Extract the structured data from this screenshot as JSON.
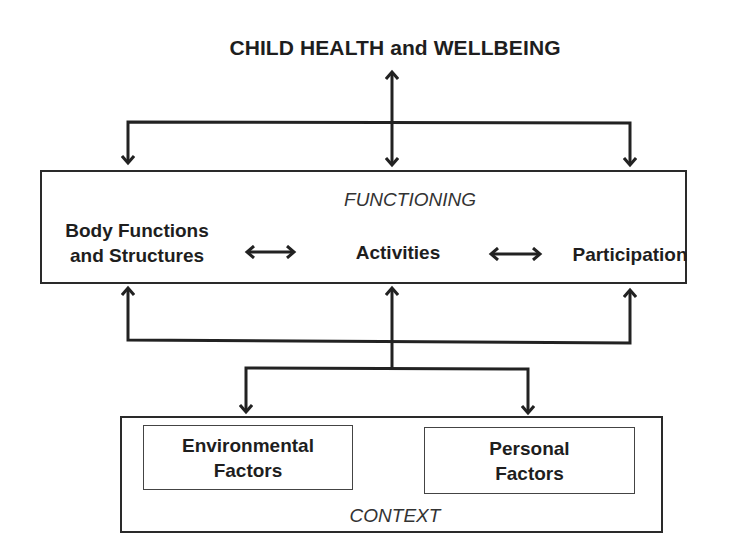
{
  "diagram": {
    "title": "CHILD HEALTH and WELLBEING",
    "functioning": {
      "label": "FUNCTIONING",
      "components": [
        {
          "line1": "Body Functions",
          "line2": "and Structures"
        },
        {
          "line1": "Activities"
        },
        {
          "line1": "Participation"
        }
      ],
      "bidirectional_arrows": [
        "Body Functions and Structures <-> Activities",
        "Activities <-> Participation"
      ]
    },
    "context": {
      "label": "CONTEXT",
      "factors": [
        {
          "line1": "Environmental",
          "line2": "Factors"
        },
        {
          "line1": "Personal",
          "line2": "Factors"
        }
      ]
    },
    "colors": {
      "line": "#222222",
      "background": "#ffffff"
    }
  }
}
